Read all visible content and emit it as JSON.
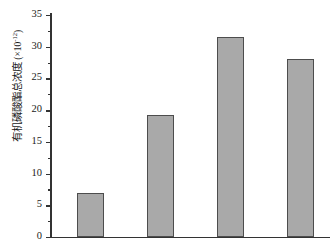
{
  "chart_data": {
    "type": "bar",
    "title": "",
    "xlabel": "",
    "ylabel": "有机磷酸酯总浓度 (×10⁻¹²)",
    "ylabel_text": "有机磷酸酯总浓度",
    "ylabel_unit_prefix": "(×10",
    "ylabel_unit_exponent": "-12",
    "ylabel_unit_suffix": ")",
    "categories": [
      "",
      "",
      "",
      ""
    ],
    "values": [
      6.9,
      19.2,
      31.6,
      28.1
    ],
    "ylim": [
      0,
      35
    ],
    "ytick_labels": [
      "0",
      "5",
      "10",
      "15",
      "20",
      "25",
      "30",
      "35"
    ],
    "ytick_values": [
      0,
      5,
      10,
      15,
      20,
      25,
      30,
      35
    ],
    "ytick_minor_step": 2.5,
    "grid": false,
    "legend": false,
    "bar_color": "#a9a9a9",
    "bar_edge_color": "#4d4d4d",
    "axis_color": "#333333"
  }
}
